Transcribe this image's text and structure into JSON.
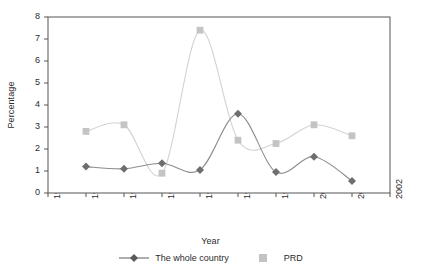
{
  "chart_data": {
    "type": "line",
    "title": "",
    "xlabel": "Year",
    "ylabel": "Percentage",
    "x": [
      1993,
      1994,
      1995,
      1996,
      1997,
      1998,
      1999,
      2000,
      2001,
      2002
    ],
    "xtick_labels": [
      "1993",
      "1994",
      "1995",
      "1996",
      "1997",
      "1998",
      "1999",
      "2000",
      "2001",
      "2002"
    ],
    "xlim": [
      1993,
      2002
    ],
    "ylim": [
      0,
      8
    ],
    "ytick_labels": [
      "0",
      "1",
      "2",
      "3",
      "4",
      "5",
      "6",
      "7",
      "8"
    ],
    "yticks": [
      0,
      1,
      2,
      3,
      4,
      5,
      6,
      7,
      8
    ],
    "grid": false,
    "smooth": true,
    "legend_position": "bottom",
    "series": [
      {
        "name": "The whole country",
        "marker": "diamond",
        "color": "#6e6e6e",
        "line_color": "#8c8c8c",
        "x": [
          1994,
          1995,
          1996,
          1997,
          1998,
          1999,
          2000,
          2001
        ],
        "values": [
          1.2,
          1.1,
          1.35,
          1.05,
          3.6,
          0.95,
          1.65,
          0.55
        ]
      },
      {
        "name": "PRD",
        "marker": "square",
        "color": "#c4c4c4",
        "line_color": "#d2d2d2",
        "x": [
          1994,
          1995,
          1996,
          1997,
          1998,
          1999,
          2000,
          2001
        ],
        "values": [
          2.8,
          3.1,
          0.9,
          7.4,
          2.4,
          2.25,
          3.1,
          2.6
        ]
      }
    ]
  },
  "plot": {
    "background": "#ffffff",
    "border_color": "#555555",
    "axis_color": "#555555"
  },
  "legend": {
    "items": [
      {
        "label": "The whole country",
        "marker": "diamond",
        "color": "#5a5a5a"
      },
      {
        "label": "PRD",
        "marker": "square",
        "color": "#c4c4c4"
      }
    ]
  }
}
